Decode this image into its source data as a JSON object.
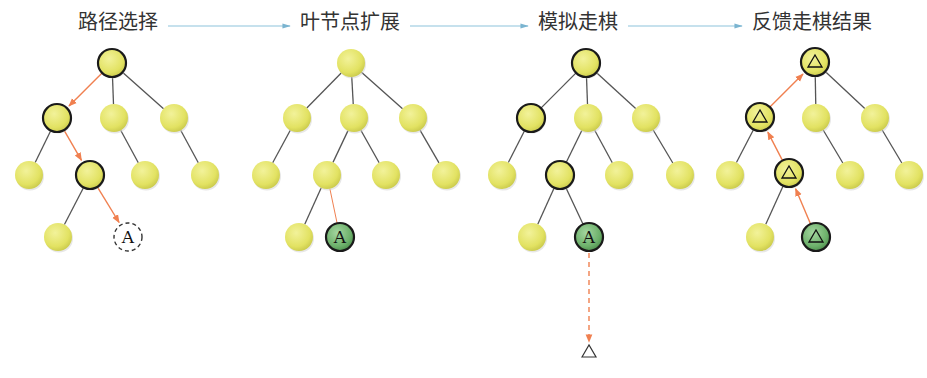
{
  "colors": {
    "node_fill": "#e4e46a",
    "node_fill_highlight": "#ecec7a",
    "node_stroke_bold": "#1a1a1a",
    "leaf_green": "#6fb36f",
    "edge": "#555555",
    "path_arrow": "#f08050",
    "flow_arrow": "#8ec4dc",
    "title_text": "#333333"
  },
  "steps": [
    {
      "label": "路径选择",
      "x": 78
    },
    {
      "label": "叶节点扩展",
      "x": 300
    },
    {
      "label": "模拟走棋",
      "x": 538
    },
    {
      "label": "反馈走棋结果",
      "x": 752
    }
  ],
  "flow_arrows": [
    {
      "x1": 168,
      "x2": 290,
      "y": 26
    },
    {
      "x1": 410,
      "x2": 528,
      "y": 26
    },
    {
      "x1": 628,
      "x2": 742,
      "y": 26
    }
  ],
  "trees": [
    {
      "name": "selection",
      "nodes": [
        {
          "id": "r",
          "x": 112,
          "y": 63,
          "bold": true
        },
        {
          "id": "a",
          "x": 57,
          "y": 118,
          "bold": true
        },
        {
          "id": "b",
          "x": 114,
          "y": 118
        },
        {
          "id": "c",
          "x": 174,
          "y": 118
        },
        {
          "id": "d",
          "x": 29,
          "y": 175
        },
        {
          "id": "e",
          "x": 90,
          "y": 175,
          "bold": true
        },
        {
          "id": "f",
          "x": 145,
          "y": 175
        },
        {
          "id": "g",
          "x": 205,
          "y": 175
        },
        {
          "id": "h",
          "x": 58,
          "y": 237
        },
        {
          "id": "A",
          "x": 128,
          "y": 237,
          "type": "dashed",
          "label": "A"
        }
      ],
      "edges": [
        [
          "r",
          "b"
        ],
        [
          "r",
          "c"
        ],
        [
          "a",
          "d"
        ],
        [
          "b",
          "f"
        ],
        [
          "c",
          "g"
        ],
        [
          "e",
          "h"
        ]
      ],
      "path_edges": [
        [
          "r",
          "a"
        ],
        [
          "a",
          "e"
        ],
        [
          "e",
          "A"
        ]
      ]
    },
    {
      "name": "expansion",
      "nodes": [
        {
          "id": "r",
          "x": 351,
          "y": 63
        },
        {
          "id": "a",
          "x": 297,
          "y": 118
        },
        {
          "id": "b",
          "x": 354,
          "y": 118
        },
        {
          "id": "c",
          "x": 413,
          "y": 118
        },
        {
          "id": "d",
          "x": 266,
          "y": 175
        },
        {
          "id": "e",
          "x": 327,
          "y": 175
        },
        {
          "id": "f",
          "x": 386,
          "y": 175
        },
        {
          "id": "g",
          "x": 446,
          "y": 175
        },
        {
          "id": "h",
          "x": 299,
          "y": 237
        },
        {
          "id": "A",
          "x": 340,
          "y": 237,
          "type": "green",
          "label": "A"
        }
      ],
      "edges": [
        [
          "r",
          "a"
        ],
        [
          "r",
          "b"
        ],
        [
          "r",
          "c"
        ],
        [
          "a",
          "d"
        ],
        [
          "b",
          "e"
        ],
        [
          "b",
          "f"
        ],
        [
          "c",
          "g"
        ],
        [
          "e",
          "h"
        ]
      ],
      "thin_orange_edges": [
        [
          "e",
          "A"
        ]
      ]
    },
    {
      "name": "simulation",
      "nodes": [
        {
          "id": "r",
          "x": 586,
          "y": 63,
          "bold": true
        },
        {
          "id": "a",
          "x": 531,
          "y": 118,
          "bold": true
        },
        {
          "id": "b",
          "x": 588,
          "y": 118
        },
        {
          "id": "c",
          "x": 646,
          "y": 118
        },
        {
          "id": "d",
          "x": 502,
          "y": 175
        },
        {
          "id": "e",
          "x": 560,
          "y": 175,
          "bold": true
        },
        {
          "id": "f",
          "x": 619,
          "y": 175
        },
        {
          "id": "g",
          "x": 680,
          "y": 175
        },
        {
          "id": "h",
          "x": 532,
          "y": 237
        },
        {
          "id": "A",
          "x": 589,
          "y": 237,
          "type": "green",
          "label": "A"
        }
      ],
      "edges": [
        [
          "r",
          "a"
        ],
        [
          "r",
          "b"
        ],
        [
          "r",
          "c"
        ],
        [
          "a",
          "d"
        ],
        [
          "b",
          "e"
        ],
        [
          "b",
          "f"
        ],
        [
          "c",
          "g"
        ],
        [
          "e",
          "h"
        ],
        [
          "e",
          "A"
        ]
      ],
      "rollout": {
        "x": 589,
        "y1": 253,
        "y2": 342,
        "result_symbol": "△",
        "result_y": 351
      }
    },
    {
      "name": "backpropagation",
      "nodes": [
        {
          "id": "r",
          "x": 815,
          "y": 62,
          "bold": true,
          "label": "△"
        },
        {
          "id": "a",
          "x": 760,
          "y": 117,
          "bold": true,
          "label": "△"
        },
        {
          "id": "b",
          "x": 816,
          "y": 118
        },
        {
          "id": "c",
          "x": 875,
          "y": 118
        },
        {
          "id": "d",
          "x": 730,
          "y": 175
        },
        {
          "id": "e",
          "x": 789,
          "y": 173,
          "bold": true,
          "label": "△"
        },
        {
          "id": "f",
          "x": 850,
          "y": 175
        },
        {
          "id": "g",
          "x": 909,
          "y": 175
        },
        {
          "id": "h",
          "x": 760,
          "y": 237
        },
        {
          "id": "A",
          "x": 816,
          "y": 237,
          "type": "green",
          "label": "△"
        }
      ],
      "edges": [
        [
          "r",
          "b"
        ],
        [
          "r",
          "c"
        ],
        [
          "a",
          "d"
        ],
        [
          "b",
          "f"
        ],
        [
          "c",
          "g"
        ],
        [
          "e",
          "h"
        ]
      ],
      "back_edges": [
        [
          "A",
          "e"
        ],
        [
          "e",
          "a"
        ],
        [
          "a",
          "r"
        ]
      ]
    }
  ]
}
